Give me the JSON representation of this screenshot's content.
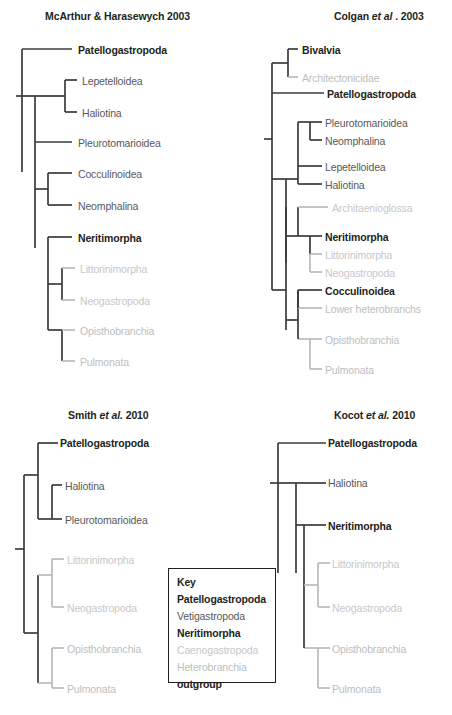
{
  "figure": {
    "panels": [
      {
        "id": "mcarthur",
        "title_prefix": "McArthur & Harasewych 2003",
        "title_italic": "",
        "title_suffix": "",
        "tips": [
          {
            "label": "Patellogastropoda",
            "group": "patellogastropoda"
          },
          {
            "label": "Lepetelloidea",
            "group": "vetigastropoda"
          },
          {
            "label": "Haliotina",
            "group": "vetigastropoda"
          },
          {
            "label": "Pleurotomarioidea",
            "group": "vetigastropoda"
          },
          {
            "label": "Cocculinoidea",
            "group": "vetigastropoda"
          },
          {
            "label": "Neomphalina",
            "group": "vetigastropoda"
          },
          {
            "label": "Neritimorpha",
            "group": "neritimorpha"
          },
          {
            "label": "Littorinimorpha",
            "group": "caenogastropoda"
          },
          {
            "label": "Neogastropoda",
            "group": "caenogastropoda"
          },
          {
            "label": "Opisthobranchia",
            "group": "heterobranchia"
          },
          {
            "label": "Pulmonata",
            "group": "heterobranchia"
          }
        ]
      },
      {
        "id": "colgan",
        "title_prefix": "Colgan ",
        "title_italic": "et al",
        "title_suffix": " . 2003",
        "tips": [
          {
            "label": "Bivalvia",
            "group": "outgroup"
          },
          {
            "label": "Architectonicidae",
            "group": "heterobranchia"
          },
          {
            "label": "Patellogastropoda",
            "group": "patellogastropoda"
          },
          {
            "label": "Pleurotomarioidea",
            "group": "vetigastropoda"
          },
          {
            "label": "Neomphalina",
            "group": "vetigastropoda"
          },
          {
            "label": "Lepetelloidea",
            "group": "vetigastropoda"
          },
          {
            "label": "Haliotina",
            "group": "vetigastropoda"
          },
          {
            "label": "Architaenioglossa",
            "group": "caenogastropoda"
          },
          {
            "label": "Neritimorpha",
            "group": "neritimorpha"
          },
          {
            "label": "Littorinimorpha",
            "group": "caenogastropoda"
          },
          {
            "label": "Neogastropoda",
            "group": "caenogastropoda"
          },
          {
            "label": "Cocculinoidea",
            "group": "vetigastropoda-bold"
          },
          {
            "label": "Lower heterobranchs",
            "group": "heterobranchia"
          },
          {
            "label": "Opisthobranchia",
            "group": "heterobranchia"
          },
          {
            "label": "Pulmonata",
            "group": "heterobranchia"
          }
        ]
      },
      {
        "id": "smith",
        "title_prefix": "Smith ",
        "title_italic": "et al.",
        "title_suffix": " 2010",
        "tips": [
          {
            "label": "Patellogastropoda",
            "group": "patellogastropoda"
          },
          {
            "label": "Haliotina",
            "group": "vetigastropoda"
          },
          {
            "label": "Pleurotomarioidea",
            "group": "vetigastropoda"
          },
          {
            "label": "Littorinimorpha",
            "group": "caenogastropoda"
          },
          {
            "label": "Neogastropoda",
            "group": "caenogastropoda"
          },
          {
            "label": "Opisthobranchia",
            "group": "heterobranchia"
          },
          {
            "label": "Pulmonata",
            "group": "heterobranchia"
          }
        ]
      },
      {
        "id": "kocot",
        "title_prefix": "Kocot ",
        "title_italic": "et al.",
        "title_suffix": " 2010",
        "tips": [
          {
            "label": "Patellogastropoda",
            "group": "patellogastropoda"
          },
          {
            "label": "Haliotina",
            "group": "vetigastropoda"
          },
          {
            "label": "Neritimorpha",
            "group": "neritimorpha"
          },
          {
            "label": "Littorinimorpha",
            "group": "caenogastropoda"
          },
          {
            "label": "Neogastropoda",
            "group": "caenogastropoda"
          },
          {
            "label": "Opisthobranchia",
            "group": "heterobranchia"
          },
          {
            "label": "Pulmonata",
            "group": "heterobranchia"
          }
        ]
      }
    ],
    "key": {
      "title": "Key",
      "entries": [
        {
          "label": "Patellogastropoda",
          "group": "patellogastropoda"
        },
        {
          "label": "Vetigastropoda",
          "group": "vetigastropoda"
        },
        {
          "label": "Neritimorpha",
          "group": "neritimorpha"
        },
        {
          "label": "Caenogastropoda",
          "group": "caenogastropoda"
        },
        {
          "label": "Heterobranchia",
          "group": "heterobranchia"
        },
        {
          "label": "outgroup",
          "group": "outgroup"
        }
      ]
    },
    "colors": {
      "patellogastropoda": "#231f20",
      "vetigastropoda": "#58595b",
      "neritimorpha": "#231f20",
      "caenogastropoda": "#c7c8ca",
      "heterobranchia": "#bcbec0",
      "outgroup": "#231f20",
      "branch": "#3b3b3d",
      "branch_light": "#b9babc",
      "background": "#ffffff"
    }
  }
}
